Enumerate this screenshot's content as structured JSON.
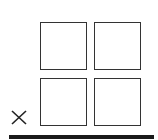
{
  "grid": {
    "cells": [
      {
        "label": "",
        "row": 0,
        "col": 0
      },
      {
        "label": "",
        "row": 0,
        "col": 1
      },
      {
        "label": "",
        "row": 1,
        "col": 0
      },
      {
        "label": "",
        "row": 1,
        "col": 1
      }
    ],
    "border_color": "#333333"
  },
  "close": {
    "icon": "close-icon",
    "glyph": "×"
  },
  "bar": {
    "color": "#1a1a1a"
  }
}
